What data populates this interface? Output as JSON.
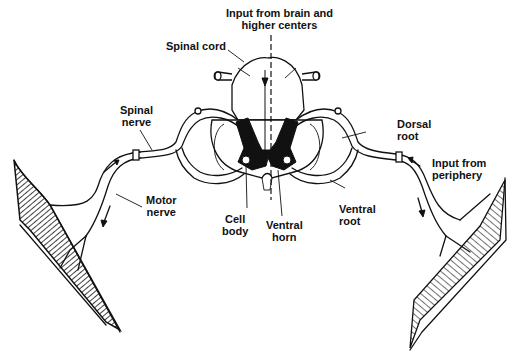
{
  "diagram": {
    "labels": {
      "input_brain": "Input from brain and\nhigher centers",
      "spinal_cord": "Spinal cord",
      "spinal_nerve": "Spinal\nnerve",
      "dorsal_root": "Dorsal\nroot",
      "input_periphery": "Input from\nperiphery",
      "motor_nerve": "Motor\nnerve",
      "cell_body": "Cell\nbody",
      "ventral_horn": "Ventral\nhorn",
      "ventral_root": "Ventral\nroot"
    },
    "colors": {
      "ink": "#111111",
      "background": "#ffffff"
    }
  }
}
